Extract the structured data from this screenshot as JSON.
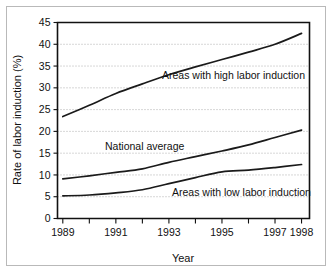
{
  "chart_data": {
    "type": "line",
    "title": "",
    "xlabel": "Year",
    "ylabel": "Rate of labor induction (%)",
    "x": [
      1989,
      1990,
      1991,
      1992,
      1993,
      1994,
      1995,
      1996,
      1997,
      1998
    ],
    "xlim": [
      1988.8,
      1998.3
    ],
    "ylim": [
      0,
      45
    ],
    "yticks": [
      0,
      5,
      10,
      15,
      20,
      25,
      30,
      35,
      40,
      45
    ],
    "ytick_labels": [
      "0",
      "5",
      "10",
      "15",
      "20",
      "25",
      "30",
      "35",
      "40",
      "45"
    ],
    "xticks": [
      1989,
      1990,
      1991,
      1992,
      1993,
      1994,
      1995,
      1996,
      1997,
      1998
    ],
    "xtick_labels": [
      "1989",
      "",
      "1991",
      "",
      "1993",
      "",
      "1995",
      "",
      "1997",
      "1998"
    ],
    "grid": "horizontal-dotted",
    "legend": "inline-annotations",
    "series": [
      {
        "name": "Areas with high labor induction",
        "label_text": "Areas with high labor induction",
        "values": [
          23.4,
          26.0,
          28.7,
          30.9,
          33.0,
          34.8,
          36.5,
          38.2,
          40.0,
          42.5
        ]
      },
      {
        "name": "National average",
        "label_text": "National average",
        "values": [
          9.1,
          9.8,
          10.6,
          11.4,
          12.9,
          14.2,
          15.5,
          16.9,
          18.6,
          20.3
        ]
      },
      {
        "name": "Areas with low labor induction",
        "label_text": "Areas with low labor induction",
        "values": [
          5.2,
          5.4,
          5.9,
          6.6,
          8.0,
          9.4,
          10.7,
          11.1,
          11.7,
          12.4
        ]
      }
    ]
  },
  "axes": {
    "y_axis_title": "Rate of labor induction (%)",
    "x_axis_title": "Year"
  },
  "annotations": {
    "high": "Areas with high labor induction",
    "national": "National average",
    "low": "Areas with low labor induction"
  },
  "colors": {
    "line": "#1a1a1a",
    "axis": "#111111",
    "grid": "#9a9a9a",
    "frame": "#b9b9b9",
    "background": "#ffffff"
  }
}
